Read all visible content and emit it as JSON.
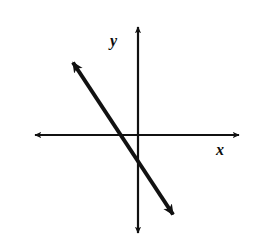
{
  "figure": {
    "background_color": "#ffffff",
    "stroke_color": "#111111",
    "width": 253,
    "height": 250
  },
  "labels": {
    "y_axis": "y",
    "x_axis": "x"
  },
  "chart_data": {
    "type": "line",
    "title": "",
    "xlabel": "x",
    "ylabel": "y",
    "grid": false,
    "legend": "none",
    "axes": {
      "origin_px": [
        138,
        135
      ],
      "x_axis_px": [
        [
          31,
          135
        ],
        [
          243,
          135
        ]
      ],
      "y_axis_px": [
        [
          138,
          22
        ],
        [
          138,
          238
        ]
      ],
      "arrowheads": [
        "left",
        "right",
        "up",
        "down"
      ],
      "ticks": [],
      "tick_labels": []
    },
    "series": [
      {
        "name": "line",
        "kind": "infinite-line",
        "endpoints_px": [
          [
            68,
            55
          ],
          [
            178,
            222
          ]
        ],
        "arrowheads": [
          "up-left",
          "down-right"
        ],
        "slope": -1.5,
        "x_intercept_px": [
          113,
          135
        ],
        "y_intercept_px": [
          138,
          178
        ],
        "stroke_width": 4
      }
    ]
  }
}
